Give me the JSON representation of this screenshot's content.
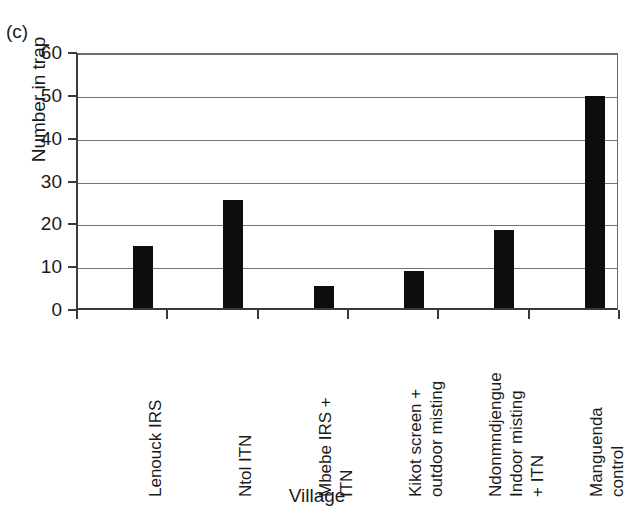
{
  "figure": {
    "panel_label": "(c)",
    "ylabel": "Number in trap",
    "xlabel": "Village"
  },
  "chart_data": {
    "type": "bar",
    "title": "",
    "panel": "(c)",
    "xlabel": "Village",
    "ylabel": "Number in trap",
    "ylim": [
      0,
      60
    ],
    "ytick_labels": [
      "0",
      "10",
      "20",
      "30",
      "40",
      "50",
      "60"
    ],
    "ytick_values": [
      0,
      10,
      20,
      30,
      40,
      50,
      60
    ],
    "grid": "horizontal",
    "legend": "none",
    "bar_color": "#0d0d0d",
    "categories": [
      "Lenouck IRS",
      "Ntol ITN",
      "Mbebe IRS + ITN",
      "Kikot screen + outdoor misting",
      "Ndonmndjengue Indoor misting + ITN",
      "Manguenda control"
    ],
    "category_lines": [
      [
        "Lenouck IRS"
      ],
      [
        "Ntol ITN"
      ],
      [
        "Mbebe IRS +",
        "ITN"
      ],
      [
        "Kikot screen +",
        "outdoor misting"
      ],
      [
        "Ndonmndjengue",
        "Indoor misting",
        "+ ITN"
      ],
      [
        "Manguenda",
        "control"
      ]
    ],
    "values": [
      14.5,
      25.2,
      5.2,
      8.7,
      18.2,
      49.6
    ]
  }
}
